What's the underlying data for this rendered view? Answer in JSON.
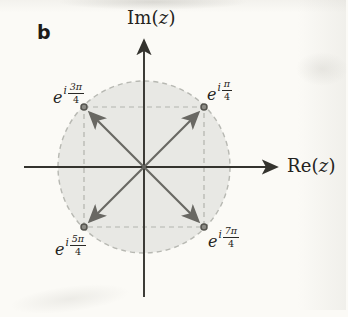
{
  "figure": {
    "panel_label": "b"
  },
  "axes": {
    "x": {
      "prefix": "Re(",
      "var": "z",
      "suffix": ")"
    },
    "y": {
      "prefix": "Im(",
      "var": "z",
      "suffix": ")"
    }
  },
  "circle": {
    "radius": 1,
    "style": "dashed outline, light gray fill"
  },
  "points": [
    {
      "base": "e",
      "imag_unit": "i",
      "numerator": "π",
      "denominator": "4",
      "angle": "π/4",
      "re": 0.7071,
      "im": 0.7071,
      "quadrant": "NE"
    },
    {
      "base": "e",
      "imag_unit": "i",
      "numerator": "3π",
      "denominator": "4",
      "angle": "3π/4",
      "re": -0.7071,
      "im": 0.7071,
      "quadrant": "NW"
    },
    {
      "base": "e",
      "imag_unit": "i",
      "numerator": "5π",
      "denominator": "4",
      "angle": "5π/4",
      "re": -0.7071,
      "im": -0.7071,
      "quadrant": "SW"
    },
    {
      "base": "e",
      "imag_unit": "i",
      "numerator": "7π",
      "denominator": "4",
      "angle": "7π/4",
      "re": 0.7071,
      "im": -0.7071,
      "quadrant": "SE"
    }
  ],
  "colors": {
    "paper": "#fbfaf6",
    "circle_fill": "#e8e8e4",
    "dashed_line": "#b7b8b2",
    "arrow": "#696863",
    "axis": "#34332e",
    "dot": "#55544f",
    "text": "#242320"
  }
}
